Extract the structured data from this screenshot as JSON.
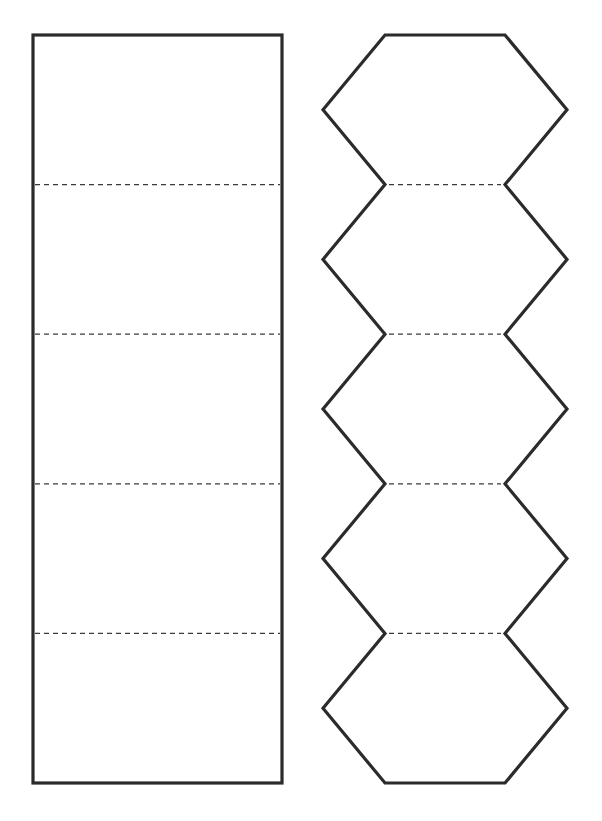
{
  "diagram": {
    "title": "",
    "colors": {
      "background": "#ffffff",
      "outline": "#2b2b2b",
      "fold_line": "#3a3a3a"
    },
    "templates": [
      {
        "id": "rectangle-strip",
        "shape": "rectangle",
        "segments": 5,
        "fold_lines": 4,
        "fold_line_style": "dashed"
      },
      {
        "id": "hexagon-strip",
        "shape": "hexagon",
        "segments": 5,
        "fold_lines": 4,
        "fold_line_style": "dashed"
      }
    ]
  }
}
